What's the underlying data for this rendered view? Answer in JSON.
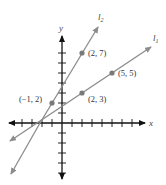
{
  "diagram": {
    "axes": {
      "x_label": "x",
      "y_label": "y",
      "x_ticks": [
        -4,
        -3,
        -2,
        -1,
        1,
        2,
        3,
        4,
        5,
        6,
        7
      ],
      "y_ticks": [
        -5,
        -4,
        -3,
        -2,
        -1,
        1,
        2,
        3,
        4,
        5,
        6,
        7
      ],
      "axis_color": "#111111"
    },
    "lines": [
      {
        "name": "l1",
        "label": "l",
        "subscript": "1",
        "through": [
          [
            2,
            3
          ],
          [
            5,
            5
          ]
        ],
        "color": "#8c8c8c"
      },
      {
        "name": "l2",
        "label": "l",
        "subscript": "2",
        "through": [
          [
            -1,
            2
          ],
          [
            2,
            7
          ]
        ],
        "color": "#8c8c8c"
      }
    ],
    "points": [
      {
        "x": -1,
        "y": 2,
        "label": "(−1, 2)"
      },
      {
        "x": 2,
        "y": 7,
        "label": "(2, 7)"
      },
      {
        "x": 2,
        "y": 3,
        "label": "(2, 3)"
      },
      {
        "x": 5,
        "y": 5,
        "label": "(5, 5)"
      }
    ],
    "point_color": "#7a7a7a"
  }
}
